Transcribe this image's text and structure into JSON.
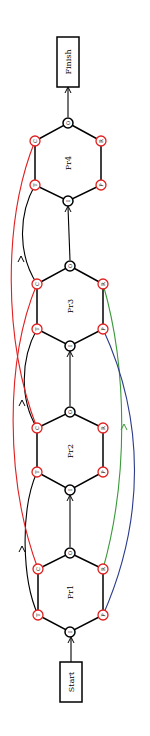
{
  "diagram": {
    "orientation": "rotated-90-ccw",
    "start_label": "Start",
    "finish_label": "Finish",
    "colors": {
      "node_outline": "#000000",
      "port_outline": "#e02020",
      "edge_c": "#e02020",
      "edge_t": "#000000",
      "edge_r": "#3a9a3a",
      "edge_p": "#2a3a8a"
    },
    "processes": [
      {
        "name": "Pr1",
        "ports": {
          "O": "O",
          "I": "I",
          "C": "C",
          "T": "T",
          "R": "R",
          "P": "P"
        }
      },
      {
        "name": "Pr2",
        "ports": {
          "O": "O",
          "I": "I",
          "C": "C",
          "T": "T",
          "R": "R",
          "P": "P"
        }
      },
      {
        "name": "Pr3",
        "ports": {
          "O": "O",
          "I": "I",
          "C": "C",
          "T": "T",
          "R": "R",
          "P": "P"
        }
      },
      {
        "name": "Pr4",
        "ports": {
          "O": "O",
          "I": "I",
          "C": "C",
          "T": "T",
          "R": "R",
          "P": "P"
        }
      }
    ],
    "edges": [
      {
        "from": "Start",
        "to": "Pr1.I"
      },
      {
        "from": "Pr1.O",
        "to": "Pr2.I"
      },
      {
        "from": "Pr2.O",
        "to": "Pr3.I"
      },
      {
        "from": "Pr3.O",
        "to": "Pr4.I"
      },
      {
        "from": "Pr4.O",
        "to": "Finish"
      },
      {
        "from": "Pr1.T",
        "to": "Pr2.T",
        "color": "black"
      },
      {
        "from": "Pr2.C",
        "to": "Pr3.T",
        "color": "black"
      },
      {
        "from": "Pr3.C",
        "to": "Pr4.T",
        "color": "black"
      },
      {
        "from": "Pr1.C",
        "to": "Pr3.C",
        "color": "red"
      },
      {
        "from": "Pr2.C",
        "to": "Pr4.C",
        "color": "red"
      },
      {
        "from": "Pr1.R",
        "to": "Pr3.R",
        "color": "green"
      },
      {
        "from": "Pr1.P",
        "to": "Pr3.P",
        "color": "blue"
      }
    ]
  }
}
